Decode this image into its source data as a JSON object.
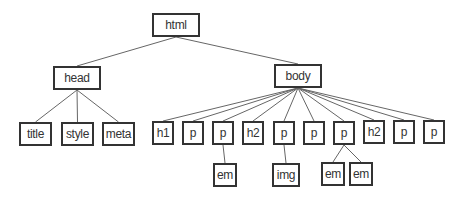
{
  "diagram": {
    "type": "tree",
    "title": "",
    "colors": {
      "line": "#666666",
      "border": "#333333",
      "text": "#333333",
      "background": "#ffffff"
    },
    "nodes": [
      {
        "id": "html",
        "label": "html",
        "x": 152,
        "y": 13,
        "w": 48,
        "h": 24
      },
      {
        "id": "head",
        "label": "head",
        "x": 53,
        "y": 66,
        "w": 48,
        "h": 24
      },
      {
        "id": "body",
        "label": "body",
        "x": 274,
        "y": 64,
        "w": 48,
        "h": 24
      },
      {
        "id": "title",
        "label": "title",
        "x": 19,
        "y": 122,
        "w": 33,
        "h": 24
      },
      {
        "id": "style",
        "label": "style",
        "x": 61,
        "y": 122,
        "w": 33,
        "h": 24
      },
      {
        "id": "meta",
        "label": "meta",
        "x": 102,
        "y": 122,
        "w": 33,
        "h": 24
      },
      {
        "id": "h1",
        "label": "h1",
        "x": 152,
        "y": 121,
        "w": 22,
        "h": 24
      },
      {
        "id": "p1",
        "label": "p",
        "x": 182,
        "y": 121,
        "w": 22,
        "h": 24
      },
      {
        "id": "p2",
        "label": "p",
        "x": 212,
        "y": 121,
        "w": 22,
        "h": 24
      },
      {
        "id": "h2a",
        "label": "h2",
        "x": 242,
        "y": 121,
        "w": 22,
        "h": 24
      },
      {
        "id": "p3",
        "label": "p",
        "x": 273,
        "y": 121,
        "w": 22,
        "h": 24
      },
      {
        "id": "p4",
        "label": "p",
        "x": 303,
        "y": 121,
        "w": 22,
        "h": 24
      },
      {
        "id": "p5",
        "label": "p",
        "x": 333,
        "y": 121,
        "w": 22,
        "h": 24
      },
      {
        "id": "h2b",
        "label": "h2",
        "x": 363,
        "y": 120,
        "w": 22,
        "h": 24
      },
      {
        "id": "p6",
        "label": "p",
        "x": 393,
        "y": 120,
        "w": 22,
        "h": 24
      },
      {
        "id": "p7",
        "label": "p",
        "x": 423,
        "y": 120,
        "w": 22,
        "h": 24
      },
      {
        "id": "em1",
        "label": "em",
        "x": 213,
        "y": 163,
        "w": 24,
        "h": 24
      },
      {
        "id": "img",
        "label": "img",
        "x": 272,
        "y": 163,
        "w": 28,
        "h": 24
      },
      {
        "id": "em2",
        "label": "em",
        "x": 321,
        "y": 162,
        "w": 24,
        "h": 24
      },
      {
        "id": "em3",
        "label": "em",
        "x": 349,
        "y": 162,
        "w": 24,
        "h": 24
      }
    ],
    "edges": [
      [
        "html",
        "head"
      ],
      [
        "html",
        "body"
      ],
      [
        "head",
        "title"
      ],
      [
        "head",
        "style"
      ],
      [
        "head",
        "meta"
      ],
      [
        "body",
        "h1"
      ],
      [
        "body",
        "p1"
      ],
      [
        "body",
        "p2"
      ],
      [
        "body",
        "h2a"
      ],
      [
        "body",
        "p3"
      ],
      [
        "body",
        "p4"
      ],
      [
        "body",
        "p5"
      ],
      [
        "body",
        "h2b"
      ],
      [
        "body",
        "p6"
      ],
      [
        "body",
        "p7"
      ],
      [
        "p2",
        "em1"
      ],
      [
        "p3",
        "img"
      ],
      [
        "p5",
        "em2"
      ],
      [
        "p5",
        "em3"
      ]
    ]
  }
}
